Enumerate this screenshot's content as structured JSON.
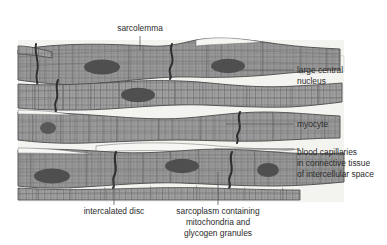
{
  "figure": {
    "background_color": "#ffffff",
    "cell_fill_color": "#9a9a9a",
    "cell_fill_color_alt": "#a4a4a4",
    "striation_color": "#6f6f6f",
    "nucleus_color": "#4f4f4f",
    "intercalated_disc_color": "#2e2e2e",
    "intercellular_space_color": "#f2f2ef",
    "membrane_outline_color": "#4a4a4a",
    "leader_line_color": "#5c5c5c",
    "label_text_color": "#2b2b2b"
  },
  "labels": {
    "sarcolemma": {
      "text": "sarcolemma",
      "lines": [
        "sarcolemma"
      ],
      "position": "top",
      "x": 140,
      "y": 33,
      "anchor": "middle"
    },
    "large_central_nucleus": {
      "text": "large central nucleus",
      "lines": [
        "large central",
        "nucleus"
      ],
      "position": "right",
      "x": 297,
      "y": 74,
      "anchor": "start"
    },
    "myocyte": {
      "text": "myocyte",
      "lines": [
        "myocyte"
      ],
      "position": "right",
      "x": 297,
      "y": 127,
      "anchor": "start"
    },
    "blood_capillaries": {
      "text": "blood capillaries in connective tissue of intercellular space",
      "lines": [
        "blood capillaries",
        "in connective tissue",
        "of intercellular space"
      ],
      "position": "right",
      "x": 297,
      "y": 155,
      "anchor": "start"
    },
    "intercalated_disc": {
      "text": "intercalated disc",
      "lines": [
        "intercalated disc"
      ],
      "position": "bottom",
      "x": 114,
      "y": 212,
      "anchor": "middle"
    },
    "sarcoplasm": {
      "text": "sarcoplasm containing mitochondria and glycogen granules",
      "lines": [
        "sarcoplasm containing",
        "mitochondria and",
        "glycogen granules"
      ],
      "position": "bottom",
      "x": 218,
      "y": 212,
      "anchor": "middle"
    }
  },
  "structures": {
    "nuclei_count": 7,
    "intercalated_disc_count": 6,
    "myocyte_band_count": 4,
    "striations": "transverse and longitudinal grid"
  }
}
